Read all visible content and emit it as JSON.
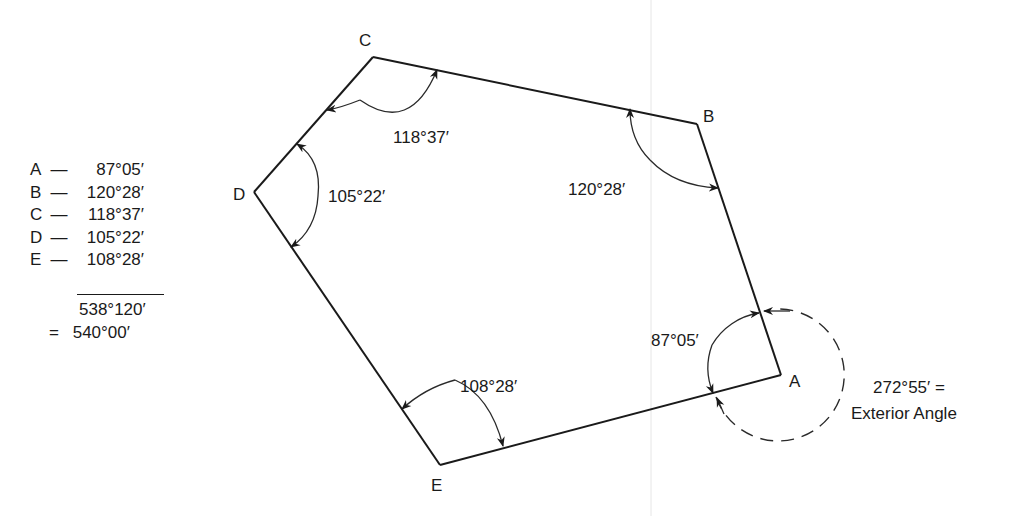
{
  "diagram": {
    "vertices": [
      {
        "id": "A",
        "label": "A",
        "x": 781,
        "y": 375
      },
      {
        "id": "B",
        "label": "B",
        "x": 697,
        "y": 124
      },
      {
        "id": "C",
        "label": "C",
        "x": 373,
        "y": 57
      },
      {
        "id": "D",
        "label": "D",
        "x": 254,
        "y": 192
      },
      {
        "id": "E",
        "label": "E",
        "x": 440,
        "y": 465
      }
    ],
    "interior_angles": {
      "A": "87°05′",
      "B": "120°28′",
      "C": "118°37′",
      "D": "105°22′",
      "E": "108°28′"
    },
    "exterior_angle": {
      "value": "272°55′ =",
      "caption": "Exterior Angle"
    }
  },
  "tally": {
    "rows": [
      {
        "key": "A",
        "sep": "—",
        "value": "87°05′"
      },
      {
        "key": "B",
        "sep": "—",
        "value": "120°28′"
      },
      {
        "key": "C",
        "sep": "—",
        "value": "118°37′"
      },
      {
        "key": "D",
        "sep": "—",
        "value": "105°22′"
      },
      {
        "key": "E",
        "sep": "—",
        "value": "108°28′"
      }
    ],
    "subtotal": "538°120′",
    "total_prefix": "=",
    "total": "540°00′"
  }
}
